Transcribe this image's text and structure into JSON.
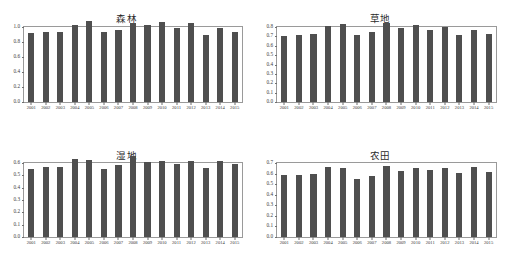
{
  "figure": {
    "layout": "2x2-grid",
    "background": "#ffffff",
    "bar_color": "#4f4f4f",
    "axis_color": "#9a9a9a"
  },
  "chart_data": [
    {
      "type": "bar",
      "title": "森林",
      "xlabel": "",
      "ylabel": "",
      "ylim": [
        0.0,
        1.0
      ],
      "yticks": [
        "1.0",
        "0.8",
        "0.6",
        "0.4",
        "0.2",
        "0.0"
      ],
      "ytick_values": [
        1.0,
        0.8,
        0.6,
        0.4,
        0.2,
        0.0
      ],
      "grid": false,
      "legend": "none",
      "categories": [
        "2001",
        "2002",
        "2003",
        "2004",
        "2005",
        "2006",
        "2007",
        "2008",
        "2009",
        "2010",
        "2011",
        "2012",
        "2013",
        "2014",
        "2015"
      ],
      "values": [
        0.92,
        0.93,
        0.94,
        1.03,
        1.08,
        0.93,
        0.96,
        1.06,
        1.03,
        1.07,
        0.99,
        1.06,
        0.9,
        0.99,
        0.94
      ]
    },
    {
      "type": "bar",
      "title": "草地",
      "xlabel": "",
      "ylabel": "",
      "ylim": [
        0.0,
        0.8
      ],
      "yticks": [
        "0.8",
        "0.7",
        "0.6",
        "0.5",
        "0.4",
        "0.3",
        "0.2",
        "0.1",
        "0.0"
      ],
      "ytick_values": [
        0.8,
        0.7,
        0.6,
        0.5,
        0.4,
        0.3,
        0.2,
        0.1,
        0.0
      ],
      "grid": false,
      "legend": "none",
      "categories": [
        "2001",
        "2002",
        "2003",
        "2004",
        "2005",
        "2006",
        "2007",
        "2008",
        "2009",
        "2010",
        "2011",
        "2012",
        "2013",
        "2014",
        "2015"
      ],
      "values": [
        0.7,
        0.72,
        0.73,
        0.81,
        0.83,
        0.71,
        0.75,
        0.84,
        0.79,
        0.82,
        0.77,
        0.8,
        0.71,
        0.77,
        0.73
      ]
    },
    {
      "type": "bar",
      "title": "湿地",
      "xlabel": "",
      "ylabel": "",
      "ylim": [
        0.0,
        0.6
      ],
      "yticks": [
        "0.6",
        "0.5",
        "0.4",
        "0.3",
        "0.2",
        "0.1",
        "0.0"
      ],
      "ytick_values": [
        0.6,
        0.5,
        0.4,
        0.3,
        0.2,
        0.1,
        0.0
      ],
      "grid": false,
      "legend": "none",
      "categories": [
        "2001",
        "2002",
        "2003",
        "2004",
        "2005",
        "2006",
        "2007",
        "2008",
        "2009",
        "2010",
        "2011",
        "2012",
        "2013",
        "2014",
        "2015"
      ],
      "values": [
        0.555,
        0.565,
        0.565,
        0.63,
        0.628,
        0.552,
        0.585,
        0.655,
        0.608,
        0.618,
        0.588,
        0.615,
        0.558,
        0.618,
        0.588
      ]
    },
    {
      "type": "bar",
      "title": "农田",
      "xlabel": "",
      "ylabel": "",
      "ylim": [
        0.0,
        0.7
      ],
      "yticks": [
        "0.7",
        "0.6",
        "0.5",
        "0.4",
        "0.3",
        "0.2",
        "0.1",
        "0.0"
      ],
      "ytick_values": [
        0.7,
        0.6,
        0.5,
        0.4,
        0.3,
        0.2,
        0.1,
        0.0
      ],
      "grid": false,
      "legend": "none",
      "categories": [
        "2001",
        "2002",
        "2003",
        "2004",
        "2005",
        "2006",
        "2007",
        "2008",
        "2009",
        "2010",
        "2011",
        "2012",
        "2013",
        "2014",
        "2015"
      ],
      "values": [
        0.583,
        0.585,
        0.598,
        0.665,
        0.652,
        0.548,
        0.58,
        0.672,
        0.625,
        0.652,
        0.632,
        0.651,
        0.601,
        0.658,
        0.613
      ]
    }
  ]
}
